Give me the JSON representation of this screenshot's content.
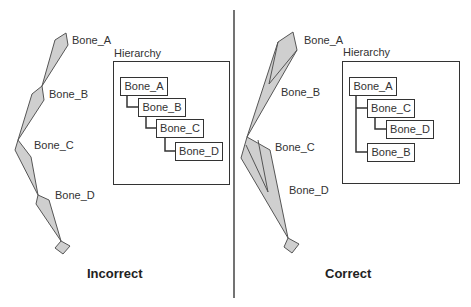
{
  "colors": {
    "bone_fill": "#cfcfcf",
    "stroke": "#555555",
    "box_stroke": "#333333",
    "divider": "#444444"
  },
  "panels": {
    "left": {
      "caption": "Incorrect",
      "bone_labels": [
        "Bone_A",
        "Bone_B",
        "Bone_C",
        "Bone_D"
      ],
      "hierarchy": {
        "title": "Hierarchy",
        "nodes": [
          {
            "label": "Bone_A",
            "depth": 0
          },
          {
            "label": "Bone_B",
            "depth": 1
          },
          {
            "label": "Bone_C",
            "depth": 2
          },
          {
            "label": "Bone_D",
            "depth": 3
          }
        ]
      }
    },
    "right": {
      "caption": "Correct",
      "bone_labels": [
        "Bone_A",
        "Bone_B",
        "Bone_C",
        "Bone_D"
      ],
      "hierarchy": {
        "title": "Hierarchy",
        "nodes": [
          {
            "label": "Bone_A",
            "depth": 0
          },
          {
            "label": "Bone_C",
            "depth": 1
          },
          {
            "label": "Bone_D",
            "depth": 2
          },
          {
            "label": "Bone_B",
            "depth": 1
          }
        ]
      }
    }
  }
}
